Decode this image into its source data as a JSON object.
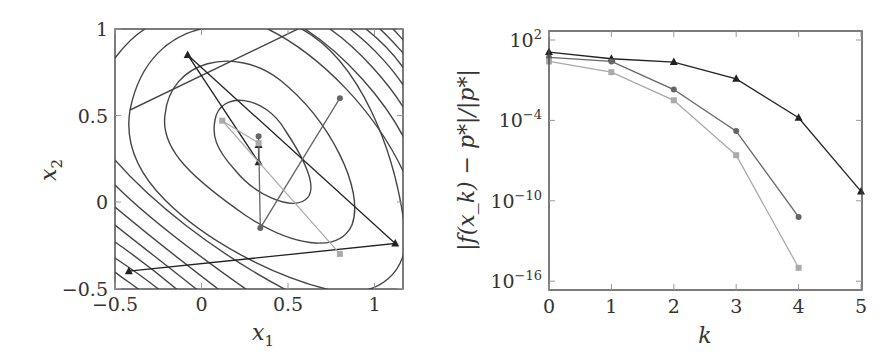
{
  "chart_data": [
    {
      "type": "line",
      "title": "",
      "subtitle": "contour plot with optimization trajectories",
      "xlabel": "x1",
      "ylabel": "x2",
      "xlim": [
        -0.5,
        1.16
      ],
      "ylim": [
        -0.5,
        1
      ],
      "xticks": [
        "-0.5",
        "0",
        "0.5",
        "1"
      ],
      "yticks": [
        "-0.5",
        "0",
        "0.5",
        "1"
      ],
      "grid": false,
      "legend": null,
      "contours": "level sets of a convex quadratic-like function, nested ellipses centred near (0.3, 0.35), tilted along the anti-diagonal",
      "series": [
        {
          "name": "triangle-path",
          "marker": "triangle",
          "color": "#222222",
          "points": [
            [
              -0.42,
              -0.4
            ],
            [
              1.12,
              -0.24
            ],
            [
              -0.08,
              0.85
            ],
            [
              0.33,
              0.23
            ],
            [
              0.33,
              0.33
            ]
          ]
        },
        {
          "name": "circle-path",
          "marker": "circle",
          "color": "#666666",
          "points": [
            [
              0.8,
              0.6
            ],
            [
              0.34,
              -0.15
            ],
            [
              0.33,
              0.38
            ]
          ]
        },
        {
          "name": "square-path",
          "marker": "square",
          "color": "#aaaaaa",
          "points": [
            [
              0.8,
              -0.3
            ],
            [
              0.12,
              0.47
            ],
            [
              0.33,
              0.34
            ]
          ]
        }
      ]
    },
    {
      "type": "line",
      "title": "",
      "xlabel": "k",
      "ylabel": "|f(x_k) − p*|/|p*|",
      "yscale": "log",
      "xlim": [
        0,
        5
      ],
      "ylim_log10": [
        -16.5,
        2.7
      ],
      "xticks": [
        "0",
        "1",
        "2",
        "3",
        "4",
        "5"
      ],
      "yticks": [
        {
          "base": "10",
          "exp": "2",
          "log10": 2
        },
        {
          "base": "10",
          "exp": "−4",
          "log10": -4
        },
        {
          "base": "10",
          "exp": "−10",
          "log10": -10
        },
        {
          "base": "10",
          "exp": "−16",
          "log10": -16
        }
      ],
      "grid": false,
      "legend": null,
      "series": [
        {
          "name": "triangle-series",
          "marker": "triangle",
          "color": "#222222",
          "x": [
            0,
            1,
            2,
            3,
            4,
            5
          ],
          "log10_values": [
            1.1,
            0.6,
            0.35,
            -0.9,
            -3.8,
            -9.3
          ]
        },
        {
          "name": "circle-series",
          "marker": "circle",
          "color": "#666666",
          "x": [
            0,
            1,
            2,
            3,
            4
          ],
          "log10_values": [
            0.7,
            0.4,
            -1.7,
            -4.8,
            -11.2
          ]
        },
        {
          "name": "square-series",
          "marker": "square",
          "color": "#aaaaaa",
          "x": [
            0,
            1,
            2,
            3,
            4
          ],
          "log10_values": [
            0.4,
            -0.4,
            -2.5,
            -6.6,
            -15.0
          ]
        }
      ]
    }
  ],
  "labels": {
    "left_x": "x",
    "left_x_sub": "1",
    "left_y": "x",
    "left_y_sub": "2",
    "right_x": "k",
    "right_y": "|f(x_k) − p*|/|p*|"
  }
}
